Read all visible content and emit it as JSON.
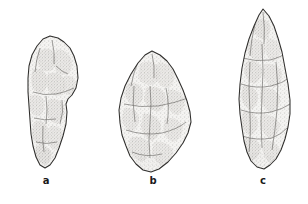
{
  "plate": {
    "background_color": "#ffffff",
    "ink_color": "#2b2b2b",
    "width": 308,
    "height": 204,
    "specimens": [
      {
        "id": "a",
        "label": "a",
        "name": "stemmed-biface-point",
        "outline_color": "#3a3a3a",
        "fill_color": "#f2f1ef",
        "shade_color": "#8d8b88",
        "bbox": {
          "x": 27,
          "y": 36,
          "width": 52,
          "height": 132
        }
      },
      {
        "id": "b",
        "label": "b",
        "name": "ovate-biface",
        "outline_color": "#3a3a3a",
        "fill_color": "#f2f1ef",
        "shade_color": "#8d8b88",
        "bbox": {
          "x": 119,
          "y": 51,
          "width": 72,
          "height": 121
        }
      },
      {
        "id": "c",
        "label": "c",
        "name": "lanceolate-point",
        "outline_color": "#3a3a3a",
        "fill_color": "#f2f1ef",
        "shade_color": "#8d8b88",
        "bbox": {
          "x": 239,
          "y": 9,
          "width": 52,
          "height": 160
        }
      }
    ]
  }
}
